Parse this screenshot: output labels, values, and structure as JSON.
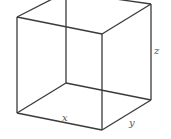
{
  "diagram": {
    "type": "wireframe-cube",
    "colors": {
      "edge": "#3a3a3a",
      "label": "#555555",
      "background": "#ffffff"
    },
    "labels": {
      "x": "x",
      "y": "y",
      "z": "z"
    },
    "vertices": {
      "front_top_left": [
        17,
        17
      ],
      "front_top_right": [
        102,
        34
      ],
      "front_bottom_left": [
        17,
        113
      ],
      "front_bottom_right": [
        102,
        130
      ],
      "back_top_left": [
        66,
        -8
      ],
      "back_top_right": [
        151,
        4
      ],
      "back_bottom_left": [
        66,
        83
      ],
      "back_bottom_right": [
        151,
        100
      ]
    }
  }
}
